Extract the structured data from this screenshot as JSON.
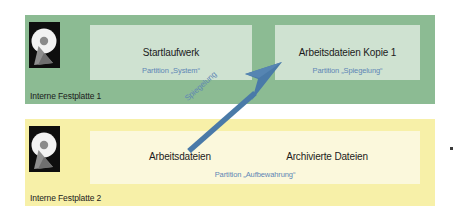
{
  "diagram": {
    "colors": {
      "disk1_background": "#8cbb93",
      "disk2_background": "#f7f0a8",
      "panel1_background": "#cfe2d1",
      "panel2_background": "#fbf8dc",
      "partition_label_text": "#5e86b5",
      "arrow": "#4a7aa8",
      "body_text": "#1b1b1b"
    },
    "disks": [
      {
        "id": "disk-1",
        "caption": "Interne Festplatte 1",
        "icon": "hard-drive-icon",
        "partitions": [
          {
            "id": "partition-system",
            "title": "Startlaufwerk",
            "subtitle": "Partition „System“"
          },
          {
            "id": "partition-mirror",
            "title": "Arbeitsdateien Kopie 1",
            "subtitle": "Partition „Spiegelung“"
          }
        ]
      },
      {
        "id": "disk-2",
        "caption": "Interne Festplatte 2",
        "icon": "hard-drive-icon",
        "partitions": [
          {
            "id": "partition-aufbewahrung",
            "subtitle": "Partition „Aufbewahrung“",
            "labels": [
              "Arbeitsdateien",
              "Archivierte Dateien"
            ]
          }
        ]
      }
    ],
    "arrow": {
      "id": "mirroring-arrow",
      "label": "Spiegelung",
      "from": "partition-aufbewahrung",
      "to": "partition-mirror",
      "direction": "up-right"
    }
  }
}
